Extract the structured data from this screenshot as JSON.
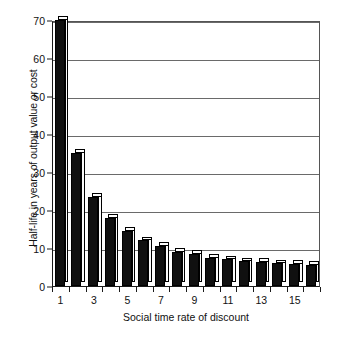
{
  "chart_data": {
    "type": "bar",
    "title": "",
    "xlabel": "Social time rate of discount",
    "ylabel": "Half-life in years of output value or cost",
    "categories": [
      "1",
      "2",
      "3",
      "4",
      "5",
      "6",
      "7",
      "8",
      "9",
      "10",
      "11",
      "12",
      "13",
      "14",
      "15",
      "16"
    ],
    "values": [
      70,
      35,
      23.5,
      18,
      14.5,
      12,
      10.5,
      9,
      8.5,
      7.5,
      7,
      6.5,
      6.3,
      6,
      5.8,
      5.5
    ],
    "ylim": [
      0,
      70
    ],
    "xlim": [
      0.5,
      16.5
    ],
    "yticks": [
      0,
      10,
      20,
      30,
      40,
      50,
      60,
      70
    ],
    "ytick_labels": [
      "0",
      "10",
      "20",
      "30",
      "40",
      "50",
      "60",
      "70"
    ],
    "xtick_values": [
      1,
      2,
      3,
      4,
      5,
      6,
      7,
      8,
      9,
      10,
      11,
      12,
      13,
      14,
      15,
      16
    ],
    "xtick_labels": [
      "1",
      "",
      "3",
      "",
      "5",
      "",
      "7",
      "",
      "9",
      "",
      "11",
      "",
      "13",
      "",
      "15",
      ""
    ],
    "grid": "horizontal",
    "legend": "none",
    "bar_style": "3d-black-front",
    "colors": {
      "bar_front": "#101010",
      "bar_top": "#fdfdfd",
      "bar_side": "#fbfbfb",
      "bar_outline": "#000000",
      "gridline": "#6a6a6a",
      "axis": "#1a1a1a",
      "background": "#ffffff",
      "text": "#111111"
    }
  }
}
